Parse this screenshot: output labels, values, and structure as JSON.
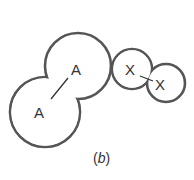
{
  "diagram": {
    "caption_open": "(",
    "caption_letter": "b",
    "caption_close": ")",
    "molecules": [
      {
        "name": "A-A",
        "atoms": [
          {
            "label": "A",
            "cx": 45,
            "cy": 112,
            "r": 35
          },
          {
            "label": "A",
            "cx": 78,
            "cy": 66,
            "r": 33
          }
        ]
      },
      {
        "name": "X-X",
        "atoms": [
          {
            "label": "X",
            "cx": 132,
            "cy": 69,
            "r": 20
          },
          {
            "label": "X",
            "cx": 166,
            "cy": 83,
            "r": 19
          }
        ]
      }
    ]
  }
}
